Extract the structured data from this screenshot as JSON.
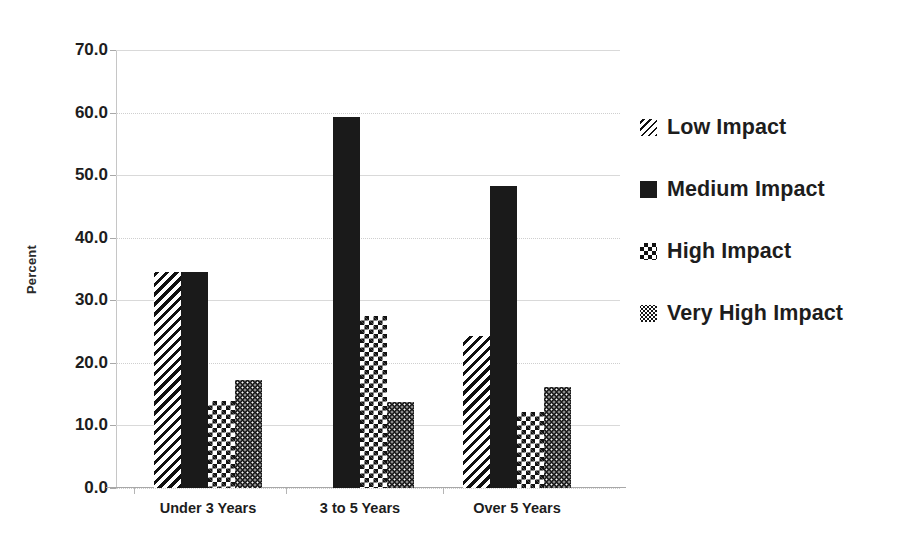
{
  "chart_data": {
    "type": "bar",
    "title": "",
    "xlabel": "",
    "ylabel": "Percent",
    "ylim": [
      0,
      70
    ],
    "ytick_step": 10,
    "ytick_labels": [
      "0.0",
      "10.0",
      "20.0",
      "30.0",
      "40.0",
      "50.0",
      "60.0",
      "70.0"
    ],
    "categories": [
      "Under 3 Years",
      "3 to 5 Years",
      "Over 5 Years"
    ],
    "grid": true,
    "legend_position": "right",
    "series": [
      {
        "name": "Low Impact",
        "pattern": "diagonal-hatch",
        "values": [
          34.6,
          0,
          24.3
        ]
      },
      {
        "name": "Medium Impact",
        "pattern": "solid-black",
        "values": [
          34.5,
          59.3,
          48.2
        ]
      },
      {
        "name": "High Impact",
        "pattern": "checkerboard",
        "values": [
          13.9,
          27.5,
          12.2
        ]
      },
      {
        "name": "Very High Impact",
        "pattern": "fine-dots",
        "values": [
          17.3,
          13.7,
          16.2
        ]
      }
    ]
  },
  "colors": {
    "ink": "#111111",
    "background": "#ffffff",
    "gridline": "#d9d9d9",
    "axis": "#a8a8a8"
  }
}
